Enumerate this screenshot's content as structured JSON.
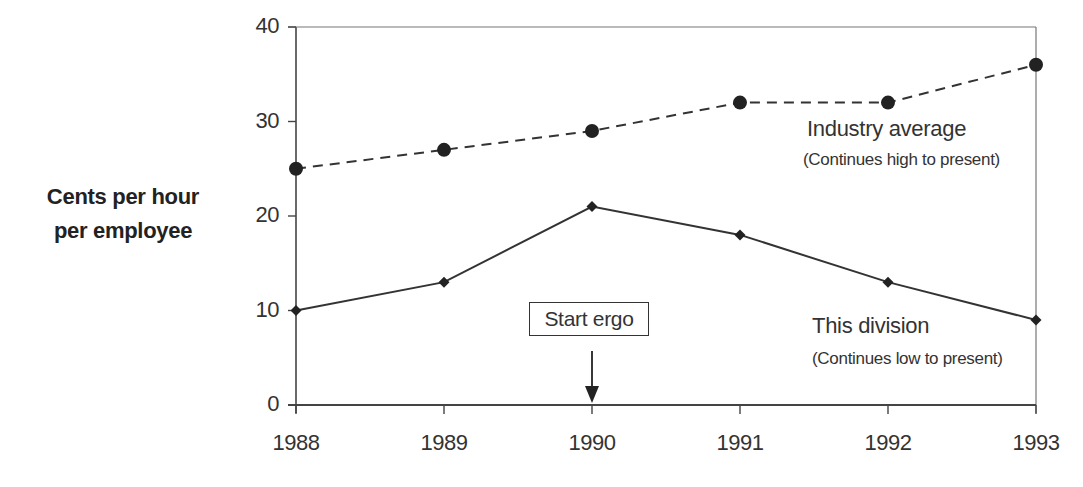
{
  "chart_data": {
    "type": "line",
    "title": "",
    "xlabel": "",
    "ylabel": "Cents per hour per employee",
    "ylabel_lines": [
      "Cents per hour",
      "per employee"
    ],
    "x": [
      "1988",
      "1989",
      "1990",
      "1991",
      "1992",
      "1993"
    ],
    "categories": [
      "1988",
      "1989",
      "1990",
      "1991",
      "1992",
      "1993"
    ],
    "yticks": [
      "0",
      "10",
      "20",
      "30",
      "40"
    ],
    "ylim": [
      0,
      40
    ],
    "grid": false,
    "series": [
      {
        "name": "Industry average",
        "note": "(Continues high to present)",
        "style": "dashed",
        "marker": "circle",
        "values": [
          25,
          27,
          29,
          32,
          32,
          36
        ]
      },
      {
        "name": "This division",
        "note": "(Continues low to present)",
        "style": "solid",
        "marker": "diamond",
        "values": [
          10,
          13,
          21,
          18,
          13,
          9
        ]
      }
    ],
    "annotations": [
      {
        "text": "Start ergo",
        "x": "1990",
        "type": "boxed-arrow"
      },
      {
        "text": "Industry average",
        "sub": "(Continues high to present)"
      },
      {
        "text": "This division",
        "sub": "(Continues low to present)"
      }
    ],
    "legend": "inline annotations"
  },
  "labels": {
    "ylabel_line1": "Cents per hour",
    "ylabel_line2": "per employee",
    "industry_title": "Industry average",
    "industry_note": "(Continues high to present)",
    "division_title": "This division",
    "division_note": "(Continues low to present)",
    "start_marker": "Start ergo"
  },
  "colors": {
    "line": "#333333",
    "marker": "#222222",
    "axis": "#444444",
    "background": "#ffffff"
  }
}
